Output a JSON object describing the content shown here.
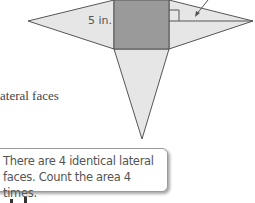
{
  "figure": {
    "dimension_label": "5 in.",
    "colors": {
      "base_fill": "#9a9a9a",
      "face_fill": "#e6e6e6",
      "edge": "#555555"
    }
  },
  "side_text": "ateral faces",
  "callout": {
    "line1": "There are 4 identical lateral",
    "line2": "faces. Count the area 4 times."
  }
}
